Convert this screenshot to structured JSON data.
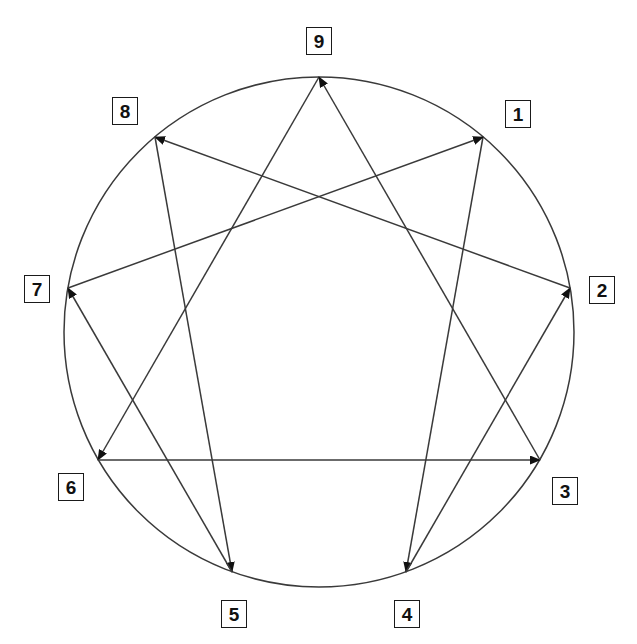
{
  "diagram": {
    "type": "enneagram-figure",
    "background_color": "#ffffff",
    "stroke_color": "#3a3a3a",
    "label_border_color": "#1a1a1a",
    "label_text_color": "#111111",
    "circle": {
      "center_x": 319,
      "center_y": 332,
      "radius": 255,
      "stroke_width": 1.5
    },
    "points": [
      {
        "number": "1",
        "angle_deg": -50,
        "x": 483,
        "y": 137,
        "label_x": 505,
        "label_y": 100
      },
      {
        "number": "2",
        "angle_deg": -10,
        "x": 570,
        "y": 288,
        "label_x": 589,
        "label_y": 276
      },
      {
        "number": "3",
        "angle_deg": 30,
        "x": 540,
        "y": 460,
        "label_x": 552,
        "label_y": 477
      },
      {
        "number": "4",
        "angle_deg": 70,
        "x": 406,
        "y": 572,
        "label_x": 394,
        "label_y": 600
      },
      {
        "number": "5",
        "angle_deg": 110,
        "x": 232,
        "y": 572,
        "label_x": 221,
        "label_y": 600
      },
      {
        "number": "6",
        "angle_deg": 150,
        "x": 98,
        "y": 460,
        "label_x": 58,
        "label_y": 473
      },
      {
        "number": "7",
        "angle_deg": 190,
        "x": 68,
        "y": 288,
        "label_x": 24,
        "label_y": 275
      },
      {
        "number": "8",
        "angle_deg": 230,
        "x": 155,
        "y": 137,
        "label_x": 112,
        "label_y": 97
      },
      {
        "number": "9",
        "angle_deg": 270,
        "x": 319,
        "y": 77,
        "label_x": 306,
        "label_y": 27
      }
    ],
    "connections": {
      "hexad_sequence": [
        "1",
        "4",
        "2",
        "8",
        "5",
        "7",
        "1"
      ],
      "triangle_sequence": [
        "9",
        "6",
        "3",
        "9"
      ],
      "arrow_direction": "forward",
      "edges": [
        {
          "from": "1",
          "to": "4",
          "group": "hexad"
        },
        {
          "from": "4",
          "to": "2",
          "group": "hexad"
        },
        {
          "from": "2",
          "to": "8",
          "group": "hexad"
        },
        {
          "from": "8",
          "to": "5",
          "group": "hexad"
        },
        {
          "from": "5",
          "to": "7",
          "group": "hexad"
        },
        {
          "from": "7",
          "to": "1",
          "group": "hexad"
        },
        {
          "from": "9",
          "to": "6",
          "group": "triangle"
        },
        {
          "from": "6",
          "to": "3",
          "group": "triangle"
        },
        {
          "from": "3",
          "to": "9",
          "group": "triangle"
        }
      ]
    }
  }
}
